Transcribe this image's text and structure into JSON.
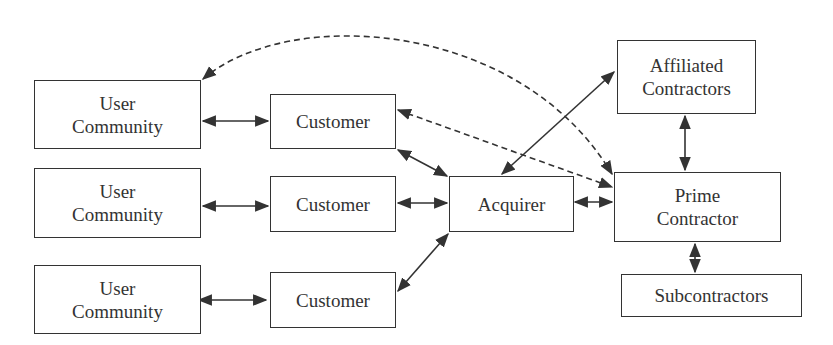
{
  "diagram": {
    "nodes": [
      {
        "id": "uc1",
        "label": "User\nCommunity",
        "x": 34,
        "y": 80,
        "w": 167,
        "h": 69
      },
      {
        "id": "uc2",
        "label": "User\nCommunity",
        "x": 34,
        "y": 168,
        "w": 167,
        "h": 70
      },
      {
        "id": "uc3",
        "label": "User\nCommunity",
        "x": 34,
        "y": 265,
        "w": 167,
        "h": 69
      },
      {
        "id": "cu1",
        "label": "Customer",
        "x": 270,
        "y": 94,
        "w": 126,
        "h": 55
      },
      {
        "id": "cu2",
        "label": "Customer",
        "x": 270,
        "y": 176,
        "w": 126,
        "h": 56
      },
      {
        "id": "cu3",
        "label": "Customer",
        "x": 270,
        "y": 272,
        "w": 126,
        "h": 56
      },
      {
        "id": "acq",
        "label": "Acquirer",
        "x": 449,
        "y": 176,
        "w": 125,
        "h": 56
      },
      {
        "id": "aff",
        "label": "Affiliated\nContractors",
        "x": 617,
        "y": 40,
        "w": 139,
        "h": 74
      },
      {
        "id": "prime",
        "label": "Prime\nContractor",
        "x": 614,
        "y": 172,
        "w": 167,
        "h": 70
      },
      {
        "id": "sub",
        "label": "Subcontractors",
        "x": 621,
        "y": 274,
        "w": 181,
        "h": 43
      }
    ],
    "edges": [
      {
        "from": "uc1",
        "to": "cu1",
        "style": "solid",
        "arrows": "both"
      },
      {
        "from": "uc2",
        "to": "cu2",
        "style": "solid",
        "arrows": "both"
      },
      {
        "from": "uc3",
        "to": "cu3",
        "style": "solid",
        "arrows": "both"
      },
      {
        "from": "cu1",
        "to": "acq",
        "style": "solid",
        "arrows": "both"
      },
      {
        "from": "cu2",
        "to": "acq",
        "style": "solid",
        "arrows": "both"
      },
      {
        "from": "cu3",
        "to": "acq",
        "style": "solid",
        "arrows": "both"
      },
      {
        "from": "acq",
        "to": "prime",
        "style": "solid",
        "arrows": "both"
      },
      {
        "from": "acq",
        "to": "aff",
        "style": "solid",
        "arrows": "both"
      },
      {
        "from": "aff",
        "to": "prime",
        "style": "solid",
        "arrows": "both"
      },
      {
        "from": "prime",
        "to": "sub",
        "style": "solid",
        "arrows": "both"
      },
      {
        "from": "cu1",
        "to": "prime",
        "style": "dashed",
        "arrows": "both"
      },
      {
        "from": "uc1",
        "to": "prime",
        "style": "dashed",
        "arrows": "both",
        "curved": true
      }
    ]
  }
}
